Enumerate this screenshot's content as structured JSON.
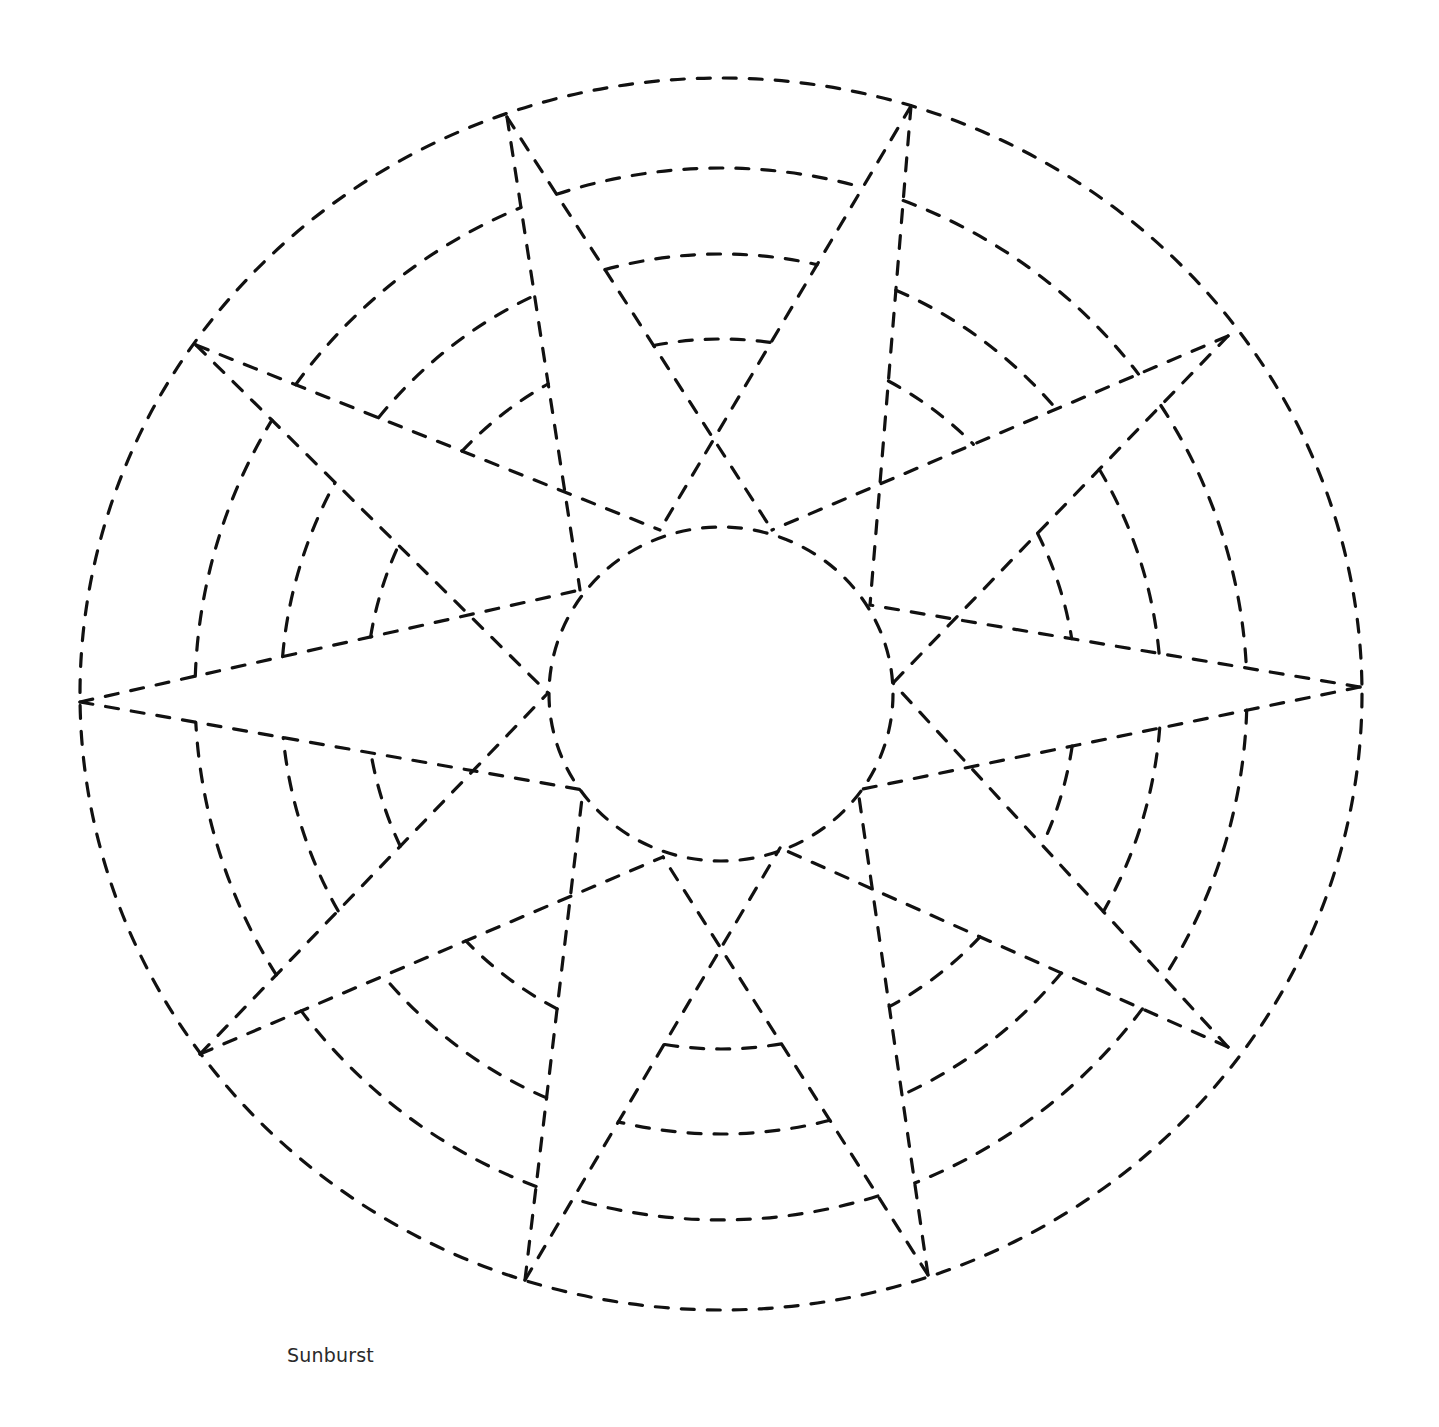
{
  "caption": "Sunburst",
  "style": {
    "stroke_color": "#111111",
    "background": "#ffffff"
  },
  "geometry": {
    "center": [
      721,
      694
    ],
    "outer": {
      "rx": 641,
      "ry": 616
    },
    "inner": {
      "rx": 172,
      "ry": 167
    },
    "star_points": [
      [
        507,
        117
      ],
      [
        911,
        106
      ],
      [
        1228,
        336
      ],
      [
        1360,
        687
      ],
      [
        1228,
        1047
      ],
      [
        928,
        1275
      ],
      [
        525,
        1280
      ],
      [
        200,
        1054
      ],
      [
        80,
        702
      ],
      [
        196,
        345
      ]
    ],
    "inner_points": [
      [
        660,
        530
      ],
      [
        772,
        530
      ],
      [
        870,
        605
      ],
      [
        893,
        683
      ],
      [
        858,
        790
      ],
      [
        780,
        848
      ],
      [
        663,
        857
      ],
      [
        583,
        790
      ],
      [
        548,
        693
      ],
      [
        580,
        590
      ]
    ],
    "arc_radii": [
      355,
      440,
      526
    ]
  }
}
